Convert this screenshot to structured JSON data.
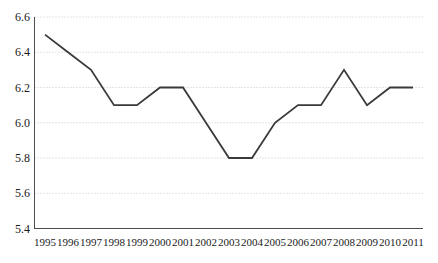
{
  "figure": {
    "width": 438,
    "height": 263,
    "background": "#ffffff"
  },
  "chart_data": {
    "type": "line",
    "title": "",
    "xlabel": "",
    "ylabel": "",
    "x": [
      1995,
      1996,
      1997,
      1998,
      1999,
      2000,
      2001,
      2002,
      2003,
      2004,
      2005,
      2006,
      2007,
      2008,
      2009,
      2010,
      2011
    ],
    "series": [
      {
        "name": "series-1",
        "values": [
          6.5,
          6.4,
          6.3,
          6.1,
          6.1,
          6.2,
          6.2,
          6.0,
          5.8,
          5.8,
          6.0,
          6.1,
          6.1,
          6.3,
          6.1,
          6.2,
          6.2
        ]
      }
    ],
    "ylim": [
      5.4,
      6.6
    ],
    "yticks": [
      5.4,
      5.6,
      5.8,
      6.0,
      6.2,
      6.4,
      6.6
    ],
    "ytick_labels": [
      "5.4",
      "5.6",
      "5.8",
      "6.0",
      "6.2",
      "6.4",
      "6.6"
    ],
    "xtick_labels": [
      "1995",
      "1996",
      "1997",
      "1998",
      "1999",
      "2000",
      "2001",
      "2002",
      "2003",
      "2004",
      "2005",
      "2006",
      "2007",
      "2008",
      "2009",
      "2010",
      "2011"
    ],
    "grid": "horizontal-dotted",
    "legend": "none",
    "colors": {
      "line": "#3a3a3a",
      "grid": "#c8c8c8",
      "axis": "#4d4d4d",
      "text": "#1a1a1a",
      "background": "#ffffff"
    }
  }
}
